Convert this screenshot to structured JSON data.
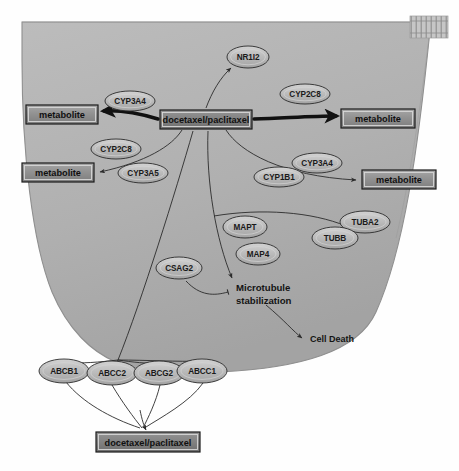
{
  "diagram": {
    "type": "biological-pathway",
    "colors": {
      "cell_fill": "#b2b2b2",
      "cell_stroke": "#8c8c8c",
      "ellipse_fill": "#b9b9b9",
      "ellipse_light": "#cfcfcf",
      "box_fill": "#8f8f8f",
      "box_dark_fill": "#7c7c7c",
      "stroke": "#2b2b2b",
      "background": "#fefefe"
    },
    "cell": {
      "name": "cell-membrane-body",
      "nucleus_hatch_label": "membrane-hatch-pattern"
    },
    "boxes": [
      {
        "id": "drug-center",
        "label": "docetaxel/paclitaxel",
        "x": 160,
        "y": 110,
        "w": 92,
        "h": 19,
        "style": "dark"
      },
      {
        "id": "metabolite-left-top",
        "label": "metabolite",
        "x": 26,
        "y": 105,
        "w": 72,
        "h": 19,
        "style": "light"
      },
      {
        "id": "metabolite-left-bottom",
        "label": "metabolite",
        "x": 22,
        "y": 163,
        "w": 72,
        "h": 19,
        "style": "light"
      },
      {
        "id": "metabolite-right-top",
        "label": "metabolite",
        "x": 341,
        "y": 109,
        "w": 74,
        "h": 19,
        "style": "light"
      },
      {
        "id": "metabolite-right-bottom",
        "label": "metabolite",
        "x": 362,
        "y": 170,
        "w": 74,
        "h": 19,
        "style": "light"
      },
      {
        "id": "drug-bottom",
        "label": "docetaxel/paclitaxel",
        "x": 96,
        "y": 432,
        "w": 104,
        "h": 20,
        "style": "dark"
      }
    ],
    "ellipses": [
      {
        "id": "nr1i2",
        "label": "NR1I2",
        "cx": 248,
        "cy": 57,
        "rx": 21,
        "ry": 11
      },
      {
        "id": "cyp3a4-left",
        "label": "CYP3A4",
        "cx": 130,
        "cy": 101,
        "rx": 25,
        "ry": 10
      },
      {
        "id": "cyp2c8-right",
        "label": "CYP2C8",
        "cx": 305,
        "cy": 94,
        "rx": 25,
        "ry": 10
      },
      {
        "id": "cyp2c8-left",
        "label": "CYP2C8",
        "cx": 116,
        "cy": 149,
        "rx": 25,
        "ry": 10
      },
      {
        "id": "cyp3a5-left",
        "label": "CYP3A5",
        "cx": 143,
        "cy": 173,
        "rx": 25,
        "ry": 10
      },
      {
        "id": "cyp3a4-right",
        "label": "CYP3A4",
        "cx": 317,
        "cy": 163,
        "rx": 25,
        "ry": 10
      },
      {
        "id": "cyp1b1",
        "label": "CYP1B1",
        "cx": 279,
        "cy": 177,
        "rx": 25,
        "ry": 10
      },
      {
        "id": "mapt",
        "label": "MAPT",
        "cx": 245,
        "cy": 227,
        "rx": 22,
        "ry": 11
      },
      {
        "id": "map4",
        "label": "MAP4",
        "cx": 258,
        "cy": 254,
        "rx": 22,
        "ry": 11
      },
      {
        "id": "tuba2",
        "label": "TUBA2",
        "cx": 365,
        "cy": 222,
        "rx": 25,
        "ry": 11
      },
      {
        "id": "tubb",
        "label": "TUBB",
        "cx": 335,
        "cy": 238,
        "rx": 23,
        "ry": 11
      },
      {
        "id": "csag2",
        "label": "CSAG2",
        "cx": 179,
        "cy": 268,
        "rx": 23,
        "ry": 11
      },
      {
        "id": "abcb1",
        "label": "ABCB1",
        "cx": 64,
        "cy": 371,
        "rx": 25,
        "ry": 12
      },
      {
        "id": "abcc2",
        "label": "ABCC2",
        "cx": 112,
        "cy": 373,
        "rx": 25,
        "ry": 12
      },
      {
        "id": "abcg2",
        "label": "ABCG2",
        "cx": 159,
        "cy": 373,
        "rx": 25,
        "ry": 12
      },
      {
        "id": "abcc1",
        "label": "ABCC1",
        "cx": 202,
        "cy": 371,
        "rx": 25,
        "ry": 12
      }
    ],
    "plain_labels": [
      {
        "id": "microtubule-stabilization-line1",
        "label": "Microtubule",
        "x": 236,
        "y": 287
      },
      {
        "id": "microtubule-stabilization-line2",
        "label": "stabilization",
        "x": 236,
        "y": 300
      },
      {
        "id": "cell-death",
        "label": "Cell Death",
        "x": 310,
        "y": 339
      }
    ]
  }
}
